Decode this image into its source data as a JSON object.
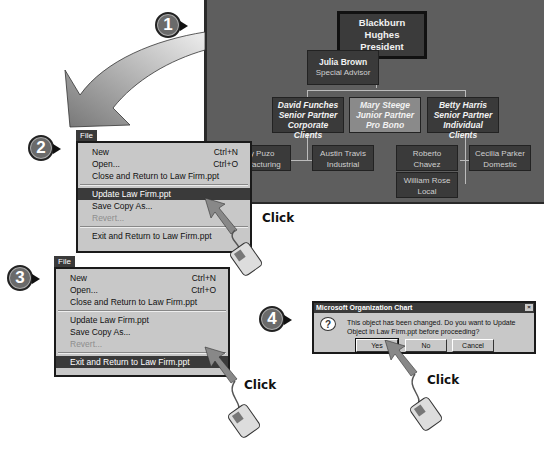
{
  "org_chart": {
    "president": {
      "name": "Blackburn Hughes",
      "title": "President"
    },
    "advisor": {
      "name": "Julia Brown",
      "title": "Special Advisor"
    },
    "partners": [
      {
        "name": "David Funches",
        "title": "Senior Partner",
        "dept": "Corporate Clients"
      },
      {
        "name": "Mary Steege",
        "title": "Junior Partner",
        "dept": "Pro Bono"
      },
      {
        "name": "Betty Harris",
        "title": "Senior Partner",
        "dept": "Individual Clients"
      }
    ],
    "staff": [
      {
        "name": "Tony Puzo",
        "title": "Manufacturing",
        "visible_name": "ony Puzo",
        "visible_title": "nufacturing"
      },
      {
        "name": "Austin Travis",
        "title": "Industrial"
      },
      {
        "name": "Roberto Chavez",
        "title": "International"
      },
      {
        "name": "Cecilia Parker",
        "title": "Domestic"
      },
      {
        "name": "William Rose",
        "title": "Local"
      }
    ]
  },
  "steps": [
    "1",
    "2",
    "3",
    "4"
  ],
  "menu": {
    "tab": "File",
    "items": [
      {
        "label": "New",
        "shortcut": "Ctrl+N"
      },
      {
        "label": "Open...",
        "shortcut": "Ctrl+O"
      },
      {
        "label": "Close and Return to Law Firm.ppt",
        "shortcut": ""
      },
      {
        "label": "Update Law Firm.ppt",
        "shortcut": ""
      },
      {
        "label": "Save Copy As...",
        "shortcut": ""
      },
      {
        "label": "Revert...",
        "shortcut": ""
      },
      {
        "label": "Exit and Return to Law Firm.ppt",
        "shortcut": ""
      }
    ]
  },
  "click_labels": [
    "Click",
    "Click",
    "Click"
  ],
  "dialog": {
    "title": "Microsoft Organization Chart",
    "close": "×",
    "icon": "?",
    "message": "This object has been changed. Do you want to Update Object in Law Firm.ppt before proceeding?",
    "buttons": [
      "Yes",
      "No",
      "Cancel"
    ]
  }
}
